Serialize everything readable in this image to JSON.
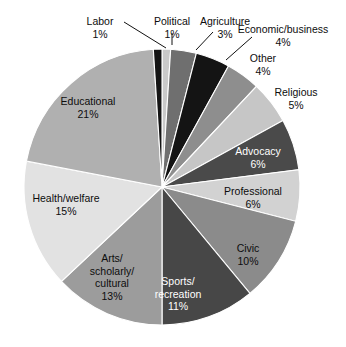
{
  "chart_data": {
    "type": "pie",
    "title": "",
    "subtitle": "",
    "xlabel": "",
    "ylabel": "",
    "legend": "none",
    "grid": false,
    "value_suffix": "%",
    "start_angle_deg": 0,
    "direction": "clockwise",
    "categories": [
      "Political",
      "Agriculture",
      "Economic/business",
      "Other",
      "Religious",
      "Advocacy",
      "Professional",
      "Civic",
      "Sports/recreation",
      "Arts/scholarly/cultural",
      "Health/welfare",
      "Educational",
      "Labor"
    ],
    "values": [
      1,
      3,
      4,
      4,
      5,
      6,
      6,
      10,
      11,
      13,
      15,
      21,
      1
    ],
    "colors": [
      "#c9c9c9",
      "#6f6f6f",
      "#141414",
      "#8e8e8e",
      "#c6c6c6",
      "#4a4a4a",
      "#d2d2d2",
      "#8b8b8b",
      "#474747",
      "#9c9c9c",
      "#e2e2e2",
      "#b0b0b0",
      "#141414"
    ],
    "slices": [
      {
        "label": "Political",
        "value": 1,
        "percent_text": "1%",
        "color": "#c9c9c9",
        "label_placement": "outside",
        "label_lines": [
          "Political"
        ],
        "text_x": 172,
        "text_y": 25,
        "leader": "M 172 33 L 172 45",
        "text_anchor": "middle",
        "text_class": "lbl-out"
      },
      {
        "label": "Agriculture",
        "value": 3,
        "percent_text": "3%",
        "color": "#6f6f6f",
        "label_placement": "outside",
        "label_lines": [
          "Agriculture"
        ],
        "text_x": 225,
        "text_y": 25,
        "leader": "M 213 32 L 196 50",
        "text_anchor": "middle",
        "text_class": "lbl-out"
      },
      {
        "label": "Economic/business",
        "value": 4,
        "percent_text": "4%",
        "color": "#141414",
        "label_placement": "outside",
        "label_lines": [
          "Economic/business"
        ],
        "text_x": 283,
        "text_y": 33,
        "leader": "M 252 37 L 226 60",
        "text_anchor": "middle",
        "text_class": "lbl-out"
      },
      {
        "label": "Other",
        "value": 4,
        "percent_text": "4%",
        "color": "#8e8e8e",
        "label_placement": "outside",
        "label_lines": [
          "Other"
        ],
        "text_x": 263,
        "text_y": 62,
        "leader": "",
        "text_anchor": "middle",
        "text_class": "lbl-out"
      },
      {
        "label": "Religious",
        "value": 5,
        "percent_text": "5%",
        "color": "#c6c6c6",
        "label_placement": "outside",
        "label_lines": [
          "Religious"
        ],
        "text_x": 296,
        "text_y": 96,
        "leader": "",
        "text_anchor": "middle",
        "text_class": "lbl-out"
      },
      {
        "label": "Advocacy",
        "value": 6,
        "percent_text": "6%",
        "color": "#4a4a4a",
        "label_placement": "inside",
        "label_lines": [
          "Advocacy"
        ],
        "text_x": 258,
        "text_y": 155,
        "leader": "",
        "text_anchor": "middle",
        "text_class": "lbl-in-dark"
      },
      {
        "label": "Professional",
        "value": 6,
        "percent_text": "6%",
        "color": "#d2d2d2",
        "label_placement": "inside",
        "label_lines": [
          "Professional"
        ],
        "text_x": 253,
        "text_y": 195,
        "leader": "",
        "text_anchor": "middle",
        "text_class": "lbl-in-light"
      },
      {
        "label": "Civic",
        "value": 10,
        "percent_text": "10%",
        "color": "#8b8b8b",
        "label_placement": "inside",
        "label_lines": [
          "Civic"
        ],
        "text_x": 248,
        "text_y": 252,
        "leader": "",
        "text_anchor": "middle",
        "text_class": "lbl-in-light"
      },
      {
        "label": "Sports/recreation",
        "value": 11,
        "percent_text": "11%",
        "color": "#474747",
        "label_placement": "inside",
        "label_lines": [
          "Sports/",
          "recreation"
        ],
        "text_x": 178,
        "text_y": 285,
        "leader": "",
        "text_anchor": "middle",
        "text_class": "lbl-in-dark"
      },
      {
        "label": "Arts/scholarly/cultural",
        "value": 13,
        "percent_text": "13%",
        "color": "#9c9c9c",
        "label_placement": "inside",
        "label_lines": [
          "Arts/",
          "scholarly/",
          "cultural"
        ],
        "text_x": 112,
        "text_y": 262,
        "leader": "",
        "text_anchor": "middle",
        "text_class": "lbl-in-light"
      },
      {
        "label": "Health/welfare",
        "value": 15,
        "percent_text": "15%",
        "color": "#e2e2e2",
        "label_placement": "inside",
        "label_lines": [
          "Health/welfare"
        ],
        "text_x": 66,
        "text_y": 202,
        "leader": "",
        "text_anchor": "middle",
        "text_class": "lbl-in-light"
      },
      {
        "label": "Educational",
        "value": 21,
        "percent_text": "21%",
        "color": "#b0b0b0",
        "label_placement": "inside",
        "label_lines": [
          "Educational"
        ],
        "text_x": 88,
        "text_y": 105,
        "leader": "",
        "text_anchor": "middle",
        "text_class": "lbl-in-light"
      },
      {
        "label": "Labor",
        "value": 1,
        "percent_text": "1%",
        "color": "#141414",
        "label_placement": "outside",
        "label_lines": [
          "Labor"
        ],
        "text_x": 100,
        "text_y": 25,
        "leader": "M 124 22 L 166 48",
        "text_anchor": "middle",
        "text_class": "lbl-out"
      }
    ],
    "geometry": {
      "cx": 162,
      "cy": 187,
      "r": 138
    }
  }
}
